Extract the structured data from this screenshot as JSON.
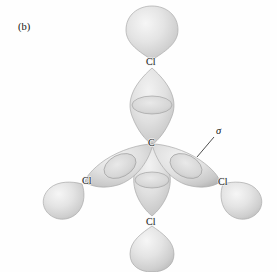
{
  "figure": {
    "panel_label": "(b)",
    "background_color": "#fefefe",
    "width": 277,
    "height": 272
  },
  "molecule": {
    "name": "carbon-tetrachloride-orbital-overlap",
    "central_atom": {
      "label": "C",
      "x": 152,
      "y": 143
    },
    "bonds": [
      {
        "id": "bond-top",
        "terminal_label": "Cl",
        "terminal_x": 152,
        "terminal_y": 62,
        "direction_deg": 270,
        "has_outer_lobe": true,
        "has_overlap_ring": true
      },
      {
        "id": "bond-bottom",
        "terminal_label": "Cl",
        "terminal_x": 152,
        "terminal_y": 222,
        "direction_deg": 90,
        "has_outer_lobe": true,
        "has_overlap_ring": true
      },
      {
        "id": "bond-left",
        "terminal_label": "Cl",
        "terminal_x": 88,
        "terminal_y": 181,
        "direction_deg": 207,
        "has_outer_lobe": true,
        "has_overlap_ring": true
      },
      {
        "id": "bond-right",
        "terminal_label": "Cl",
        "terminal_x": 223,
        "terminal_y": 182,
        "direction_deg": 333,
        "has_outer_lobe": true,
        "has_overlap_ring": true
      }
    ]
  },
  "annotation": {
    "sigma_symbol": "σ",
    "sigma_x": 219,
    "sigma_y": 130,
    "leader_from_x": 214,
    "leader_from_y": 137,
    "leader_to_x": 197,
    "leader_to_y": 157
  },
  "colors": {
    "orbital_fill_light": "#eeeeee",
    "orbital_fill_mid": "#d9d9d9",
    "orbital_fill_dark": "#bdbdbd",
    "orbital_edge": "#a8a8a8",
    "label_text": "#1a1a1a",
    "background": "#fefefe"
  }
}
